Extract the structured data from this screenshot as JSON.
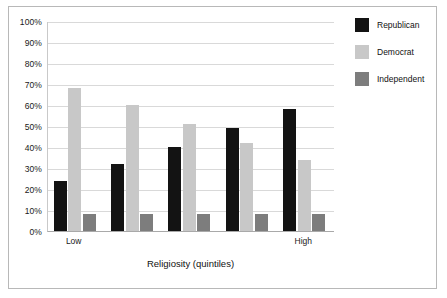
{
  "chart_data": {
    "type": "bar",
    "title": "",
    "xlabel": "Religiosity (quintiles)",
    "ylabel": "",
    "categories": [
      "Low",
      "2",
      "3",
      "4",
      "High"
    ],
    "tick_labels_shown": [
      "Low",
      "",
      "",
      "",
      "High"
    ],
    "ylim": [
      0,
      100
    ],
    "yticks": [
      "0%",
      "10%",
      "20%",
      "30%",
      "40%",
      "50%",
      "60%",
      "70%",
      "80%",
      "90%",
      "100%"
    ],
    "ytick_values": [
      0,
      10,
      20,
      30,
      40,
      50,
      60,
      70,
      80,
      90,
      100
    ],
    "grid": true,
    "legend_position": "right",
    "series": [
      {
        "name": "Republican",
        "color": "#131313",
        "values": [
          24,
          32,
          40,
          49,
          58
        ]
      },
      {
        "name": "Democrat",
        "color": "#c8c8c8",
        "values": [
          68,
          60,
          51,
          42,
          34
        ]
      },
      {
        "name": "Independent",
        "color": "#7d7d7d",
        "values": [
          8,
          8,
          8,
          8,
          8
        ]
      }
    ]
  },
  "legend": {
    "items": [
      {
        "label": "Republican"
      },
      {
        "label": "Democrat"
      },
      {
        "label": "Independent"
      }
    ]
  },
  "axis": {
    "x_title": "Religiosity (quintiles)",
    "low_label": "Low",
    "high_label": "High"
  }
}
